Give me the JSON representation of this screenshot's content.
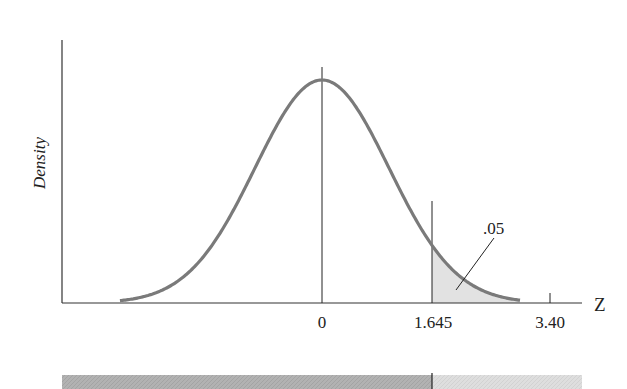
{
  "chart_data": {
    "type": "line",
    "title": "",
    "xlabel": "Z",
    "ylabel": "Density",
    "distribution": "standard normal",
    "x_range": [
      -3.02,
      2.96
    ],
    "x_ticks": [
      {
        "value": 0,
        "label": "0"
      },
      {
        "value": 1.645,
        "label": "1.645"
      },
      {
        "value": 3.4,
        "label": "3.40"
      }
    ],
    "shaded_region": {
      "from": 1.645,
      "to": 2.96,
      "area_label": ".05"
    },
    "vertical_lines": [
      0,
      1.645
    ],
    "grid": false,
    "legend": null,
    "colors": {
      "curve": "#7a7a7a",
      "axis": "#333333",
      "shade": "#e2e2e2",
      "bar_left": "#b4b4b4",
      "bar_right": "#dcdcdc"
    },
    "bottom_bar": {
      "split_at": 1.645
    }
  }
}
